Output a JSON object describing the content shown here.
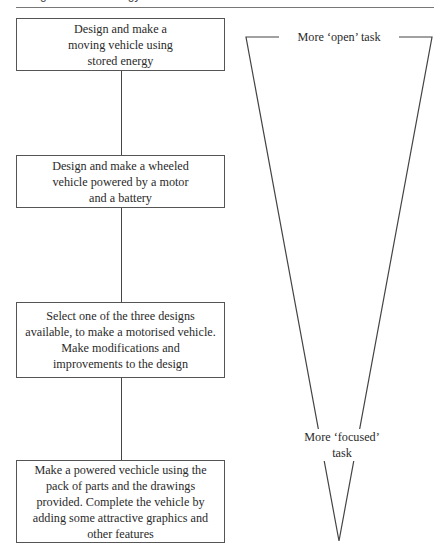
{
  "header": {
    "running_title": "Design and Technology"
  },
  "diagram": {
    "type": "task-spectrum",
    "boxes": [
      {
        "text": "Design and make a moving vehicle using stored energy"
      },
      {
        "text": "Design and make a wheeled vehicle powered by a motor and a battery"
      },
      {
        "text": "Select one of the three designs available, to make a motorised vehicle. Make modifications and improvements to the design"
      },
      {
        "text": "Make a powered vechicle using the pack of parts and the drawings provided. Complete the vehicle by adding some attractive graphics and other features"
      }
    ],
    "triangle": {
      "top_label": "More ‘open’ task",
      "bottom_label_line1": "More ‘focused’",
      "bottom_label_line2": "task"
    },
    "colors": {
      "line": "#444444",
      "text": "#2a2a2a",
      "background": "#ffffff"
    }
  }
}
